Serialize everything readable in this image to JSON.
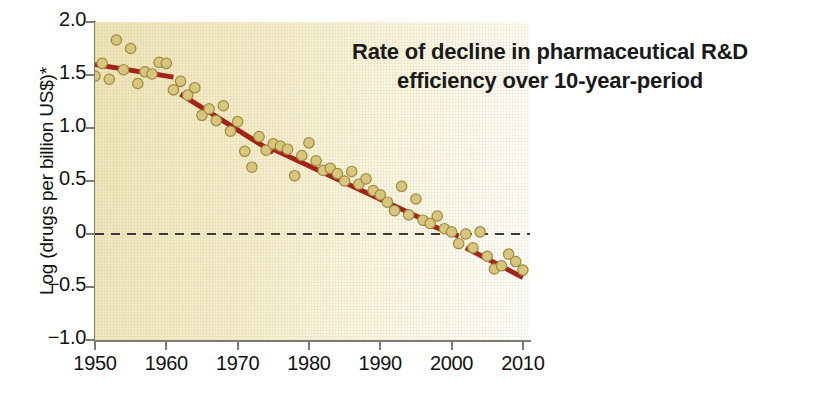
{
  "chart_data": {
    "type": "scatter",
    "title": "Rate of decline in pharmaceutical R&D efficiency over 10-year-period",
    "title_lines": [
      "Rate of decline in pharmaceutical R&D",
      "efficiency over 10-year-period"
    ],
    "xlabel": "",
    "ylabel": "Log (drugs per billion US$)*",
    "xlim": [
      1950,
      2011
    ],
    "ylim": [
      -1.0,
      2.0
    ],
    "grid": false,
    "legend": "none",
    "xticks": [
      1950,
      1960,
      1970,
      1980,
      1990,
      2000,
      2010
    ],
    "xtick_labels": [
      "1950",
      "1960",
      "1970",
      "1980",
      "1990",
      "2000",
      "2010"
    ],
    "yticks": [
      2.0,
      1.5,
      1.0,
      0.5,
      0,
      -0.5,
      -1.0
    ],
    "ytick_labels": [
      "2.0",
      "1.5",
      "1.0",
      "0.5",
      "0",
      "−0.5",
      "−1.0"
    ],
    "colors": {
      "marker_fill": "#d9c67e",
      "marker_stroke": "#9d8b3e",
      "trend_line": "#a32318",
      "zero_line": "#3a3a3a",
      "plot_background": "#f2e9c4",
      "axis": "#7d7b72",
      "title_text": "#1a1a1a"
    },
    "annotations": [
      {
        "name": "zero-reference-line",
        "type": "hline",
        "y": 0,
        "style": "dashed"
      }
    ],
    "series": [
      {
        "name": "R&D efficiency (10-year rolling)",
        "marker": "circle",
        "points": [
          [
            1950,
            1.49
          ],
          [
            1951,
            1.61
          ],
          [
            1952,
            1.46
          ],
          [
            1953,
            1.83
          ],
          [
            1954,
            1.55
          ],
          [
            1955,
            1.75
          ],
          [
            1956,
            1.42
          ],
          [
            1957,
            1.53
          ],
          [
            1958,
            1.51
          ],
          [
            1959,
            1.62
          ],
          [
            1960,
            1.61
          ],
          [
            1961,
            1.36
          ],
          [
            1962,
            1.44
          ],
          [
            1963,
            1.31
          ],
          [
            1964,
            1.38
          ],
          [
            1965,
            1.12
          ],
          [
            1966,
            1.18
          ],
          [
            1967,
            1.07
          ],
          [
            1968,
            1.21
          ],
          [
            1969,
            0.97
          ],
          [
            1970,
            1.06
          ],
          [
            1971,
            0.78
          ],
          [
            1972,
            0.63
          ],
          [
            1973,
            0.92
          ],
          [
            1974,
            0.79
          ],
          [
            1975,
            0.85
          ],
          [
            1976,
            0.83
          ],
          [
            1977,
            0.8
          ],
          [
            1978,
            0.55
          ],
          [
            1979,
            0.74
          ],
          [
            1980,
            0.86
          ],
          [
            1981,
            0.69
          ],
          [
            1982,
            0.6
          ],
          [
            1983,
            0.62
          ],
          [
            1984,
            0.57
          ],
          [
            1985,
            0.5
          ],
          [
            1986,
            0.59
          ],
          [
            1987,
            0.47
          ],
          [
            1988,
            0.52
          ],
          [
            1989,
            0.41
          ],
          [
            1990,
            0.37
          ],
          [
            1991,
            0.3
          ],
          [
            1992,
            0.22
          ],
          [
            1993,
            0.45
          ],
          [
            1994,
            0.18
          ],
          [
            1995,
            0.33
          ],
          [
            1996,
            0.13
          ],
          [
            1997,
            0.1
          ],
          [
            1998,
            0.17
          ],
          [
            1999,
            0.05
          ],
          [
            2000,
            0.02
          ],
          [
            2001,
            -0.09
          ],
          [
            2002,
            0.0
          ],
          [
            2003,
            -0.13
          ],
          [
            2004,
            0.02
          ],
          [
            2005,
            -0.21
          ],
          [
            2006,
            -0.33
          ],
          [
            2007,
            -0.3
          ],
          [
            2008,
            -0.19
          ],
          [
            2009,
            -0.26
          ],
          [
            2010,
            -0.34
          ]
        ]
      }
    ],
    "trend_segments": [
      {
        "name": "segment-1950-1961",
        "x": [
          1950,
          1961
        ],
        "y": [
          1.6,
          1.48
        ]
      },
      {
        "name": "segment-1962-1975",
        "x": [
          1962,
          1975
        ],
        "y": [
          1.32,
          0.77
        ]
      },
      {
        "name": "segment-1975-1996",
        "x": [
          1975,
          1996
        ],
        "y": [
          0.8,
          0.14
        ]
      },
      {
        "name": "segment-1996-2001",
        "x": [
          1996,
          2001
        ],
        "y": [
          0.11,
          -0.02
        ]
      },
      {
        "name": "segment-2002-2010",
        "x": [
          2002,
          2010
        ],
        "y": [
          -0.13,
          -0.41
        ]
      }
    ]
  },
  "footnote_marker": "*"
}
